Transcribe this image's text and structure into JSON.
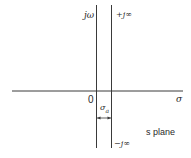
{
  "diagram": {
    "title": "s plane",
    "axes": {
      "imag_label": "jω",
      "real_label": "σ",
      "origin_label": "0"
    },
    "line_labels": {
      "top": "+j∞",
      "bottom": "−j∞"
    },
    "abscissa": {
      "label": "σa",
      "symbol": "σ",
      "subscript": "a"
    },
    "colors": {
      "line": "#3a3a3a",
      "background": "#ffffff"
    }
  }
}
